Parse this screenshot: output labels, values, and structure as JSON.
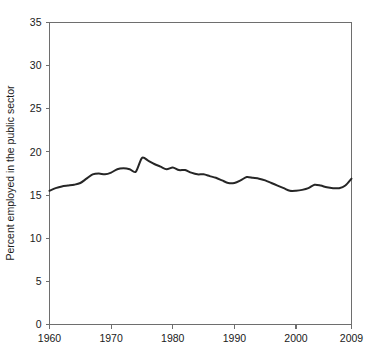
{
  "chart_data": {
    "type": "line",
    "title": "",
    "subtitle": "",
    "xlabel": "",
    "ylabel": "Percent employed in the public sector",
    "xlim": [
      1960,
      2009
    ],
    "ylim": [
      0,
      35
    ],
    "grid": false,
    "legend": "none",
    "xticks": [
      1960,
      1970,
      1980,
      1990,
      2000,
      2009
    ],
    "xticklabels": [
      "1960",
      "1970",
      "1980",
      "1990",
      "2000",
      "2009"
    ],
    "yticks": [
      0,
      5,
      10,
      15,
      20,
      25,
      30,
      35
    ],
    "yticklabels": [
      "0",
      "5",
      "10",
      "15",
      "20",
      "25",
      "30",
      "35"
    ],
    "line_color": "#262626",
    "axis_color": "#6e6e6e",
    "series": [
      {
        "name": "Percent employed in the public sector",
        "x": [
          1960,
          1961,
          1962,
          1963,
          1964,
          1965,
          1966,
          1967,
          1968,
          1969,
          1970,
          1971,
          1972,
          1973,
          1974,
          1975,
          1976,
          1977,
          1978,
          1979,
          1980,
          1981,
          1982,
          1983,
          1984,
          1985,
          1986,
          1987,
          1988,
          1989,
          1990,
          1991,
          1992,
          1993,
          1994,
          1995,
          1996,
          1997,
          1998,
          1999,
          2000,
          2001,
          2002,
          2003,
          2004,
          2005,
          2006,
          2007,
          2008,
          2009
        ],
        "values": [
          15.5,
          15.8,
          16.0,
          16.1,
          16.2,
          16.4,
          16.9,
          17.4,
          17.5,
          17.4,
          17.6,
          18.0,
          18.1,
          18.0,
          17.7,
          19.3,
          19.0,
          18.6,
          18.3,
          18.0,
          18.2,
          17.9,
          17.9,
          17.6,
          17.4,
          17.4,
          17.2,
          17.0,
          16.7,
          16.4,
          16.4,
          16.7,
          17.1,
          17.0,
          16.9,
          16.7,
          16.4,
          16.1,
          15.8,
          15.5,
          15.5,
          15.6,
          15.8,
          16.2,
          16.1,
          15.9,
          15.8,
          15.8,
          16.1,
          16.9
        ]
      }
    ]
  }
}
